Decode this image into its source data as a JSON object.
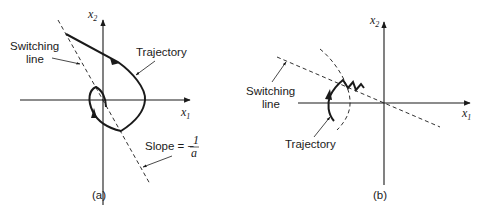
{
  "figure": {
    "panel_a": {
      "caption": "(a)",
      "axis_x_label": "x",
      "axis_x_sub": "1",
      "axis_y_label": "x",
      "axis_y_sub": "2",
      "switching_line_label_1": "Switching",
      "switching_line_label_2": "line",
      "trajectory_label": "Trajectory",
      "slope_label": "Slope = −",
      "slope_num": "1",
      "slope_den": "a"
    },
    "panel_b": {
      "caption": "(b)",
      "axis_x_label": "x",
      "axis_x_sub": "1",
      "axis_y_label": "x",
      "axis_y_sub": "2",
      "switching_line_label_1": "Switching",
      "switching_line_label_2": "line",
      "trajectory_label": "Trajectory"
    }
  },
  "colors": {
    "ink": "#1a1a1a",
    "background": "#ffffff"
  }
}
